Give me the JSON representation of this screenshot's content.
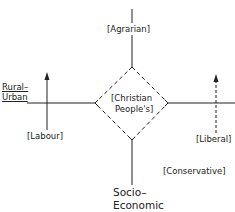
{
  "diagram": {
    "type": "cleavage-dimensions",
    "axes": {
      "horizontal_label": [
        "Rural–",
        "Urban"
      ],
      "vertical_label": [
        "Socio–",
        "Economic"
      ]
    },
    "parties": {
      "agrarian": "[Agrarian]",
      "christian": [
        "[Christian",
        "People's]"
      ],
      "labour": "[Labour]",
      "liberal": "[Liberal]",
      "conservative": "[Conservative]"
    },
    "colors": {
      "line": "#222222",
      "background": "#ffffff"
    }
  }
}
